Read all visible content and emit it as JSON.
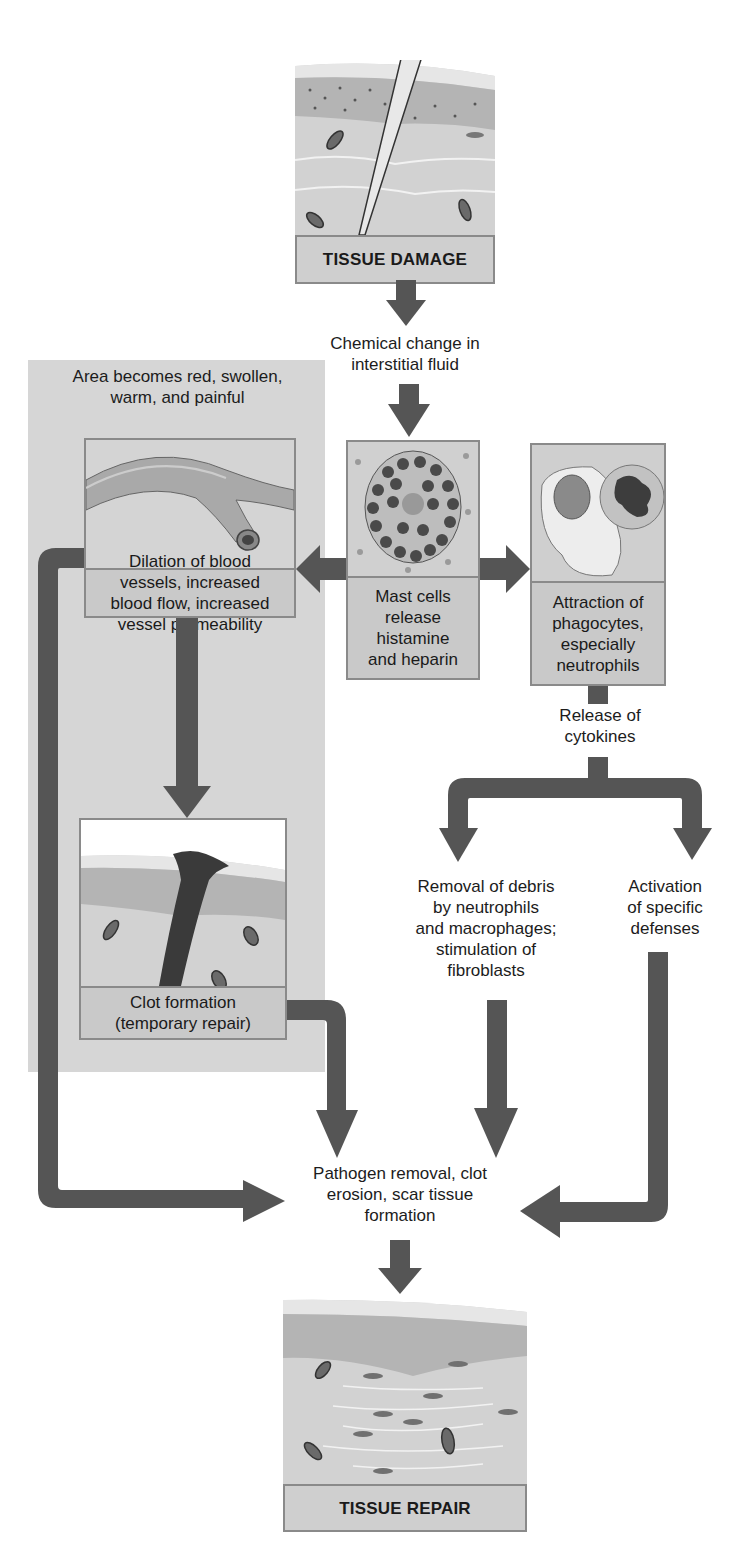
{
  "diagram": {
    "nodes": {
      "tissue_damage": {
        "label": "TISSUE DAMAGE"
      },
      "chemical_change": {
        "label_lines": [
          "Chemical change in",
          "interstitial fluid"
        ]
      },
      "panel_note": {
        "label_lines": [
          "Area becomes red, swollen,",
          "warm, and painful"
        ]
      },
      "dilation": {
        "label_lines": [
          "Dilation of blood",
          "vessels, increased",
          "blood flow, increased",
          "vessel permeability"
        ]
      },
      "mast_cells": {
        "label_lines": [
          "Mast cells",
          "release",
          "histamine",
          "and heparin"
        ]
      },
      "phagocytes": {
        "label_lines": [
          "Attraction of",
          "phagocytes,",
          "especially",
          "neutrophils"
        ]
      },
      "cytokines": {
        "label_lines": [
          "Release of",
          "cytokines"
        ]
      },
      "clot": {
        "label_lines": [
          "Clot formation",
          "(temporary repair)"
        ]
      },
      "debris_removal": {
        "label_lines": [
          "Removal of debris",
          "by neutrophils",
          "and macrophages;",
          "stimulation of",
          "fibroblasts"
        ]
      },
      "specific_defenses": {
        "label_lines": [
          "Activation",
          "of specific",
          "defenses"
        ]
      },
      "pathogen_removal": {
        "label_lines": [
          "Pathogen removal, clot",
          "erosion, scar tissue",
          "formation"
        ]
      },
      "tissue_repair": {
        "label": "TISSUE REPAIR"
      }
    },
    "edges": [
      [
        "tissue_damage",
        "chemical_change"
      ],
      [
        "chemical_change",
        "mast_cells"
      ],
      [
        "mast_cells",
        "dilation"
      ],
      [
        "mast_cells",
        "phagocytes"
      ],
      [
        "dilation",
        "clot"
      ],
      [
        "dilation",
        "pathogen_removal"
      ],
      [
        "phagocytes",
        "cytokines"
      ],
      [
        "cytokines",
        "debris_removal"
      ],
      [
        "cytokines",
        "specific_defenses"
      ],
      [
        "clot",
        "pathogen_removal"
      ],
      [
        "debris_removal",
        "pathogen_removal"
      ],
      [
        "specific_defenses",
        "pathogen_removal"
      ],
      [
        "pathogen_removal",
        "tissue_repair"
      ]
    ],
    "colors": {
      "arrow": "#555555",
      "panel": "#d6d6d6",
      "box_fill": "#cfcfcf",
      "box_border": "#8a8a8a",
      "skin_top": "#e4e4e4",
      "epidermis": "#b8b8b8",
      "dermis": "#d2d2d2"
    }
  }
}
